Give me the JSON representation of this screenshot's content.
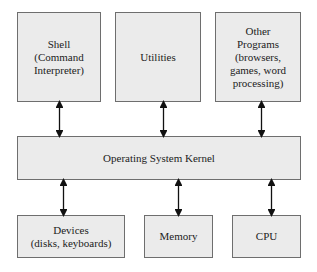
{
  "diagram": {
    "top_row": [
      {
        "id": "shell",
        "label": "Shell\n(Command\nInterpreter)"
      },
      {
        "id": "utilities",
        "label": "Utilities"
      },
      {
        "id": "other-programs",
        "label": "Other\nPrograms\n(browsers,\ngames, word\nprocessing)"
      }
    ],
    "middle": {
      "id": "kernel",
      "label": "Operating System Kernel"
    },
    "bottom_row": [
      {
        "id": "devices",
        "label": "Devices\n(disks, keyboards)"
      },
      {
        "id": "memory",
        "label": "Memory"
      },
      {
        "id": "cpu",
        "label": "CPU"
      }
    ],
    "connections": [
      {
        "from": "shell",
        "to": "kernel",
        "type": "bidirectional"
      },
      {
        "from": "utilities",
        "to": "kernel",
        "type": "bidirectional"
      },
      {
        "from": "other-programs",
        "to": "kernel",
        "type": "bidirectional"
      },
      {
        "from": "kernel",
        "to": "devices",
        "type": "bidirectional"
      },
      {
        "from": "kernel",
        "to": "memory",
        "type": "bidirectional"
      },
      {
        "from": "kernel",
        "to": "cpu",
        "type": "bidirectional"
      }
    ],
    "colors": {
      "box_fill": "#ebebeb",
      "box_border": "#6e6e6e",
      "arrow": "#111111"
    }
  }
}
